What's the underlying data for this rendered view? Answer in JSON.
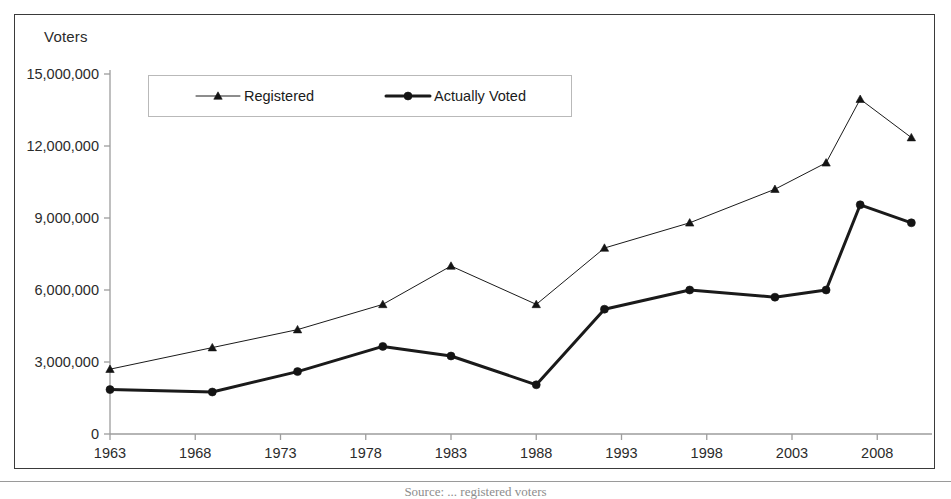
{
  "figure": {
    "y_axis_title": "Voters",
    "bottom_caption": "Source: ... registered voters"
  },
  "legend": {
    "position": "inside-top-left",
    "entries": [
      {
        "label": "Registered",
        "marker": "triangle-marker-icon",
        "color": "#1a1a1a",
        "line_width": 1
      },
      {
        "label": "Actually Voted",
        "marker": "circle-marker-icon",
        "color": "#1a1a1a",
        "line_width": 3
      }
    ]
  },
  "chart_data": {
    "type": "line",
    "title": "",
    "xlabel": "",
    "ylabel": "Voters",
    "xlim": [
      1963,
      2012
    ],
    "ylim": [
      0,
      15000000
    ],
    "grid": false,
    "legend_position": "inside-top-left",
    "x_tick_labels": [
      "1963",
      "1968",
      "1973",
      "1978",
      "1983",
      "1988",
      "1993",
      "1998",
      "2003",
      "2008"
    ],
    "x_ticks": [
      1963,
      1968,
      1973,
      1978,
      1983,
      1988,
      1993,
      1998,
      2003,
      2008
    ],
    "y_tick_labels": [
      "0",
      "3,000,000",
      "6,000,000",
      "9,000,000",
      "12,000,000",
      "15,000,000"
    ],
    "y_ticks": [
      0,
      3000000,
      6000000,
      9000000,
      12000000,
      15000000
    ],
    "x": [
      1963,
      1969,
      1974,
      1979,
      1983,
      1988,
      1992,
      1997,
      2002,
      2005,
      2007,
      2010
    ],
    "series": [
      {
        "name": "Registered",
        "marker": "triangle",
        "line_width": 1,
        "color": "#1a1a1a",
        "values": [
          2700000,
          3600000,
          4350000,
          5400000,
          7000000,
          5400000,
          7750000,
          8800000,
          10200000,
          11300000,
          13950000,
          12350000
        ]
      },
      {
        "name": "Actually Voted",
        "marker": "circle",
        "line_width": 3,
        "color": "#1a1a1a",
        "values": [
          1850000,
          1750000,
          2600000,
          3650000,
          3250000,
          2050000,
          5200000,
          6000000,
          5700000,
          6000000,
          9550000,
          8800000
        ]
      }
    ]
  }
}
